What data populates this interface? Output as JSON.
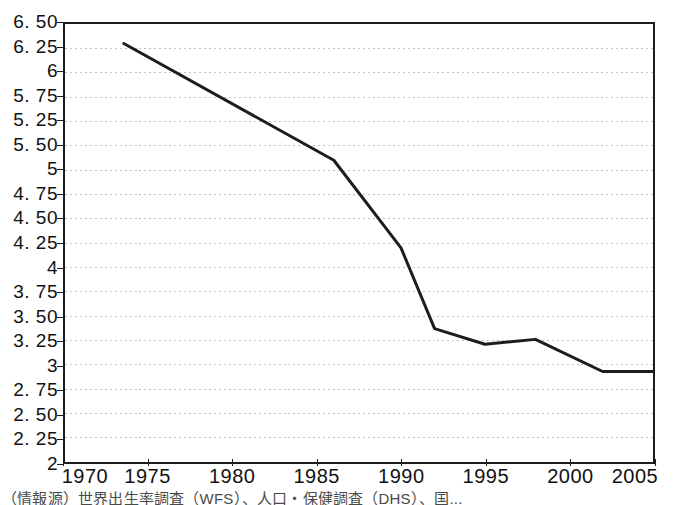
{
  "chart_data": {
    "type": "line",
    "title": "",
    "xlabel": "",
    "ylabel": "",
    "xlim": [
      1970,
      2005
    ],
    "ylim": [
      2.0,
      6.5
    ],
    "grid": true,
    "legend": null,
    "x_ticks": [
      1970,
      1975,
      1980,
      1985,
      1990,
      1995,
      2000,
      2005
    ],
    "x_tick_labels": [
      "1970",
      "1975",
      "1980",
      "1985",
      "1990",
      "1995",
      "2000",
      "2005"
    ],
    "y_ticks": [
      6.5,
      6.25,
      6.0,
      5.75,
      5.5,
      5.25,
      5.0,
      4.75,
      4.5,
      4.25,
      4.0,
      3.75,
      3.5,
      3.25,
      3.0,
      2.75,
      2.5,
      2.25,
      2.0
    ],
    "y_tick_labels": [
      "6. 50",
      "6. 25",
      "6",
      "5. 75",
      "5. 25",
      "5. 50",
      "5",
      "4. 75",
      "4. 50",
      "4. 25",
      "4",
      "3. 75",
      "3. 50",
      "3. 25",
      "3",
      "2. 75",
      "2. 50",
      "2. 25",
      "2"
    ],
    "series": [
      {
        "name": "fertility-rate",
        "color": "#1d1d1d",
        "x": [
          1973.5,
          1986.0,
          1990.0,
          1992.0,
          1995.0,
          1998.0,
          2002.0,
          2005.0
        ],
        "values": [
          6.3,
          5.1,
          4.2,
          3.37,
          3.21,
          3.26,
          2.93,
          2.93
        ]
      }
    ]
  },
  "source": {
    "caption": "（情報源）世界出生率調査（WFS）、人口・保健調査（DHS）、国..."
  }
}
